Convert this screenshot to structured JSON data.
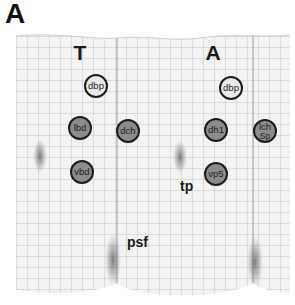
{
  "figure": {
    "panel_label": "A",
    "columns": [
      {
        "label": "T",
        "x": 80
      },
      {
        "label": "A",
        "x": 213
      }
    ],
    "spots": [
      {
        "label": "dbp",
        "x": 96,
        "y": 86,
        "style": "light"
      },
      {
        "label": "lbd",
        "x": 80,
        "y": 128,
        "style": "dark"
      },
      {
        "label": "dch",
        "x": 128,
        "y": 131,
        "style": "dark"
      },
      {
        "label": "vbd",
        "x": 82,
        "y": 172,
        "style": "dark"
      },
      {
        "label": "dbp",
        "x": 231,
        "y": 88,
        "style": "light"
      },
      {
        "label": "dh1",
        "x": 216,
        "y": 130,
        "style": "dark"
      },
      {
        "label": "lch",
        "sublabel": "Sp",
        "x": 265,
        "y": 131,
        "style": "dark"
      },
      {
        "label": "vp5",
        "x": 216,
        "y": 174,
        "style": "dark"
      }
    ],
    "annotations": [
      {
        "label": "tp",
        "x": 180,
        "y": 179
      },
      {
        "label": "psf",
        "x": 127,
        "y": 236
      }
    ],
    "colors": {
      "grid_line": "#b9b9b9",
      "paper": "#f3f3f3",
      "spot_light": "#e9e9e9",
      "spot_dark": "#8c8c8c",
      "smudge": "#6a6a6a"
    }
  }
}
